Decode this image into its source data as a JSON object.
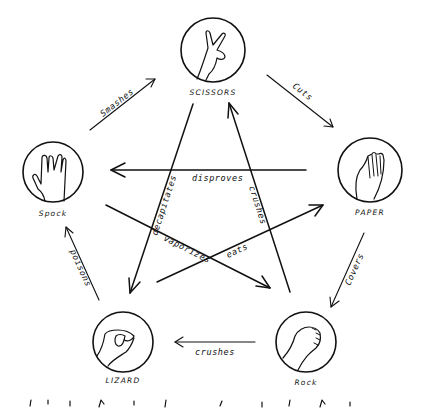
{
  "diagram": {
    "nodes": {
      "scissors": {
        "label": "SCISSORS",
        "gesture": "scissors-hand-icon"
      },
      "paper": {
        "label": "PAPER",
        "gesture": "paper-hand-icon"
      },
      "rock": {
        "label": "Rock",
        "gesture": "rock-fist-icon"
      },
      "lizard": {
        "label": "LIZARD",
        "gesture": "lizard-hand-icon"
      },
      "spock": {
        "label": "Spock",
        "gesture": "spock-hand-icon"
      }
    },
    "edges": {
      "smashes": {
        "from": "Spock",
        "to": "Scissors",
        "label": "Smashes"
      },
      "cuts": {
        "from": "Scissors",
        "to": "Paper",
        "label": "Cuts"
      },
      "covers": {
        "from": "Paper",
        "to": "Rock",
        "label": "Covers"
      },
      "crushes_lizard": {
        "from": "Rock",
        "to": "Lizard",
        "label": "crushes"
      },
      "poisons": {
        "from": "Lizard",
        "to": "Spock",
        "label": "poisons"
      },
      "disproves": {
        "from": "Paper",
        "to": "Spock",
        "label": "disproves"
      },
      "decapitates": {
        "from": "Scissors",
        "to": "Lizard",
        "label": "decapitates"
      },
      "crushes_scissors": {
        "from": "Rock",
        "to": "Scissors",
        "label": "crushes"
      },
      "vaporizes": {
        "from": "Spock",
        "to": "Rock",
        "label": "vaporizes"
      },
      "eats": {
        "from": "Lizard",
        "to": "Paper",
        "label": "eats"
      }
    }
  }
}
